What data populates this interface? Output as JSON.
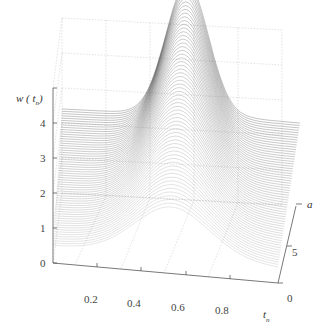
{
  "chart_data": {
    "type": "surface",
    "title": "",
    "xlabel": "t_n",
    "ylabel": "a",
    "zlabel": "w(t_n)",
    "x_ticks": [
      "0.2",
      "0.4",
      "0.6",
      "0.8"
    ],
    "y_ticks": [
      "0",
      "5"
    ],
    "z_ticks": [
      "0",
      "1",
      "2",
      "3",
      "4"
    ],
    "xlim": [
      0.05,
      1.0
    ],
    "ylim": [
      0,
      10
    ],
    "zlim": [
      0,
      5
    ],
    "grid": true,
    "series_sample": [
      {
        "a": 0,
        "t_n": [
          0.05,
          0.2,
          0.4,
          0.6,
          0.8,
          1.0
        ],
        "w": [
          0.5,
          1.1,
          1.8,
          2.0,
          1.6,
          0.9
        ]
      },
      {
        "a": 5,
        "t_n": [
          0.05,
          0.2,
          0.4,
          0.6,
          0.8,
          1.0
        ],
        "w": [
          1.4,
          1.9,
          3.0,
          3.5,
          2.6,
          1.9
        ]
      },
      {
        "a": 10,
        "t_n": [
          0.05,
          0.2,
          0.4,
          0.6,
          0.8,
          1.0
        ],
        "w": [
          2.4,
          2.5,
          3.4,
          5.0,
          3.0,
          2.4
        ]
      }
    ]
  },
  "labels": {
    "z_axis": "w ( t",
    "z_axis_sub": "n",
    "z_axis_close": ")",
    "x_axis": "t",
    "x_axis_sub": "n",
    "y_axis": "a"
  }
}
